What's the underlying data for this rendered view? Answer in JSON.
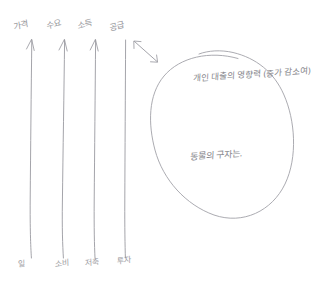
{
  "page": {
    "kind": "handwritten-sketch",
    "background_color": "#ffffff",
    "ink_color": "#9a9aa0",
    "ink_color_dark": "#7e7e85"
  },
  "arrows": {
    "vertical": [
      {
        "id": "arrow-1",
        "top_label": "가격",
        "bottom_label": "일",
        "has_head": true,
        "x": 31,
        "y_top": 38,
        "y_bottom": 258
      },
      {
        "id": "arrow-2",
        "top_label": "수요",
        "bottom_label": "소비",
        "has_head": true,
        "x": 64,
        "y_top": 38,
        "y_bottom": 258
      },
      {
        "id": "arrow-3",
        "top_label": "소득",
        "bottom_label": "저축",
        "has_head": true,
        "x": 95,
        "y_top": 38,
        "y_bottom": 258
      },
      {
        "id": "arrow-4",
        "top_label": "공급",
        "bottom_label": "투자",
        "has_head": false,
        "x": 125,
        "y_top": 38,
        "y_bottom": 258
      }
    ],
    "double_headed": {
      "id": "double-arrow",
      "x1": 133,
      "y1": 40,
      "x2": 158,
      "y2": 62,
      "description": "double-headed diagonal arrow"
    }
  },
  "circle": {
    "center_x": 222,
    "center_y": 133,
    "radius_x": 71,
    "radius_y": 85,
    "lines": [
      {
        "id": "circle-note-top",
        "text": "개인 대출의 영향력 (증가 감소여)",
        "x": 193,
        "y": 82
      },
      {
        "id": "circle-note-bottom",
        "text": "동물의 구자는.",
        "x": 190,
        "y": 161
      }
    ]
  }
}
